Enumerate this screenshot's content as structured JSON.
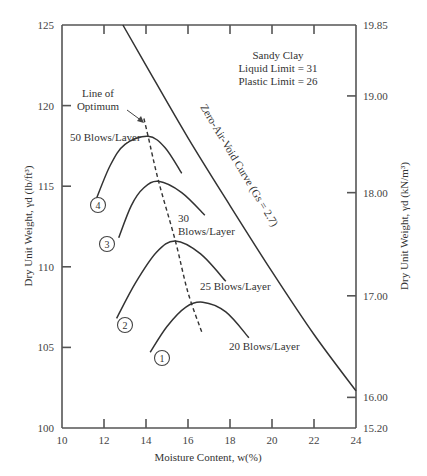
{
  "chart_data": {
    "type": "line",
    "title": "",
    "xlabel": "Moisture Content, w(%)",
    "ylabel": "Dry Unit Weight, γd (lb/ft³)",
    "ylabel_right": "Dry Unit Weight, γd (kN/m³)",
    "xlim": [
      10,
      24
    ],
    "ylim": [
      100,
      125
    ],
    "grid": false,
    "legend": "none (inline labels)",
    "x_ticks": [
      10,
      12,
      14,
      16,
      18,
      20,
      22,
      24
    ],
    "y_ticks": [
      100,
      105,
      110,
      115,
      120,
      125
    ],
    "y_right_ticks": [
      {
        "label": "15.20",
        "at": 100
      },
      {
        "label": "16.00",
        "at": 101.9
      },
      {
        "label": "17.00",
        "at": 108.2
      },
      {
        "label": "18.00",
        "at": 114.6
      },
      {
        "label": "19.00",
        "at": 120.6
      },
      {
        "label": "19.85",
        "at": 125
      }
    ],
    "annotation_box": [
      "Sandy Clay",
      "Liquid Limit = 31",
      "Plastic Limit = 26"
    ],
    "series": [
      {
        "name": "50 Blows/Layer",
        "marker": "4",
        "style": "solid",
        "points": [
          [
            11.6,
            114.1
          ],
          [
            12.3,
            116.3
          ],
          [
            13.0,
            117.6
          ],
          [
            14.1,
            118.1
          ],
          [
            14.9,
            117.4
          ],
          [
            15.7,
            115.8
          ]
        ]
      },
      {
        "name": "30 Blows/Layer",
        "marker": "3",
        "style": "solid",
        "points": [
          [
            12.7,
            111.8
          ],
          [
            13.3,
            113.8
          ],
          [
            13.9,
            114.9
          ],
          [
            14.6,
            115.3
          ],
          [
            15.7,
            114.6
          ],
          [
            16.8,
            113.2
          ]
        ]
      },
      {
        "name": "25 Blows/Layer",
        "marker": "2",
        "style": "solid",
        "points": [
          [
            12.6,
            106.8
          ],
          [
            13.5,
            109.0
          ],
          [
            14.5,
            110.9
          ],
          [
            15.4,
            111.6
          ],
          [
            16.6,
            110.8
          ],
          [
            17.8,
            109.1
          ]
        ]
      },
      {
        "name": "20 Blows/Layer",
        "marker": "1",
        "style": "solid",
        "points": [
          [
            14.2,
            104.7
          ],
          [
            15.0,
            106.3
          ],
          [
            15.9,
            107.5
          ],
          [
            16.7,
            107.8
          ],
          [
            17.8,
            107.2
          ],
          [
            18.9,
            105.6
          ]
        ]
      },
      {
        "name": "Line of Optimum",
        "style": "dashed",
        "points": [
          [
            13.9,
            119.2
          ],
          [
            14.1,
            118.1
          ],
          [
            14.6,
            115.3
          ],
          [
            15.4,
            111.6
          ],
          [
            16.0,
            108.4
          ],
          [
            16.7,
            105.8
          ]
        ]
      },
      {
        "name": "Zero-Air-Void Curve (Gs = 2.7)",
        "style": "solid",
        "points": [
          [
            12.9,
            125.0
          ],
          [
            14.0,
            122.5
          ],
          [
            16.0,
            118.0
          ],
          [
            18.0,
            113.8
          ],
          [
            20.0,
            109.7
          ],
          [
            22.0,
            105.8
          ],
          [
            24.0,
            102.3
          ]
        ]
      }
    ],
    "labels": {
      "line_of_optimum": [
        "Line of",
        "Optimum"
      ],
      "blows_50": "50 Blows/Layer",
      "blows_30": [
        "30",
        "Blows/Layer"
      ],
      "blows_25": "25 Blows/Layer",
      "blows_20": "20 Blows/Layer",
      "zav": "Zero-Air-Void Curve (Gs = 2.7)",
      "markers": [
        "1",
        "2",
        "3",
        "4"
      ]
    }
  }
}
